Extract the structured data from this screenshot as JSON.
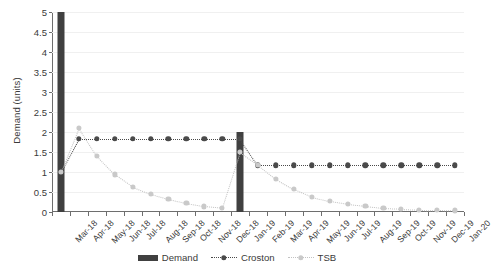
{
  "chart_data": {
    "type": "line",
    "title": "",
    "xlabel": "",
    "ylabel": "Demand (units)",
    "ylim": [
      0,
      5
    ],
    "yticks": [
      0,
      0.5,
      1,
      1.5,
      2,
      2.5,
      3,
      3.5,
      4,
      4.5,
      5
    ],
    "ytick_labels": [
      "0",
      "0.5",
      "1",
      "1.5",
      "2",
      "2.5",
      "3",
      "3.5",
      "4",
      "4.5",
      "5"
    ],
    "grid": true,
    "legend_position": "bottom",
    "categories": [
      "Mar-18",
      "Apr-18",
      "May-18",
      "Jun-18",
      "Jul-18",
      "Aug-18",
      "Sep-18",
      "Oct-18",
      "Nov-18",
      "Dec-18",
      "Jan-19",
      "Feb-19",
      "Mar-19",
      "Apr-19",
      "May-19",
      "Jun-19",
      "Jul-19",
      "Aug-19",
      "Sep-19",
      "Oct-19",
      "Nov-19",
      "Dec-19",
      "Jan-20"
    ],
    "series": [
      {
        "name": "Demand",
        "type": "bar",
        "color": "#404040",
        "values": [
          5,
          0,
          0,
          0,
          0,
          0,
          0,
          0,
          0,
          0,
          2,
          0,
          0,
          0,
          0,
          0,
          0,
          0,
          0,
          0,
          0,
          0,
          0
        ]
      },
      {
        "name": "Croston",
        "type": "line",
        "color": "#4a4a4a",
        "values": [
          1.0,
          1.83,
          1.83,
          1.83,
          1.83,
          1.83,
          1.83,
          1.83,
          1.83,
          1.83,
          1.83,
          1.17,
          1.17,
          1.17,
          1.17,
          1.17,
          1.17,
          1.17,
          1.17,
          1.17,
          1.17,
          1.17,
          1.17
        ]
      },
      {
        "name": "TSB",
        "type": "line",
        "color": "#c9c9c9",
        "values": [
          1.0,
          2.1,
          1.4,
          0.94,
          0.63,
          0.45,
          0.32,
          0.22,
          0.14,
          0.1,
          1.5,
          1.18,
          0.83,
          0.57,
          0.38,
          0.27,
          0.2,
          0.15,
          0.1,
          0.08,
          0.06,
          0.05,
          0.04
        ]
      }
    ]
  },
  "legend": {
    "items": [
      {
        "label": "Demand"
      },
      {
        "label": "Croston"
      },
      {
        "label": "TSB"
      }
    ]
  }
}
